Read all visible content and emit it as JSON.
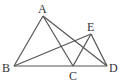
{
  "diagram": {
    "type": "geometry",
    "points": {
      "A": {
        "x": 43,
        "y": 16
      },
      "B": {
        "x": 14,
        "y": 66
      },
      "C": {
        "x": 73,
        "y": 66
      },
      "D": {
        "x": 107,
        "y": 66
      },
      "E": {
        "x": 91,
        "y": 34
      }
    },
    "segments": [
      [
        "A",
        "B"
      ],
      [
        "A",
        "C"
      ],
      [
        "A",
        "D"
      ],
      [
        "B",
        "D"
      ],
      [
        "B",
        "E"
      ],
      [
        "C",
        "E"
      ],
      [
        "E",
        "D"
      ]
    ],
    "labels": {
      "A": "A",
      "B": "B",
      "C": "C",
      "D": "D",
      "E": "E"
    }
  }
}
